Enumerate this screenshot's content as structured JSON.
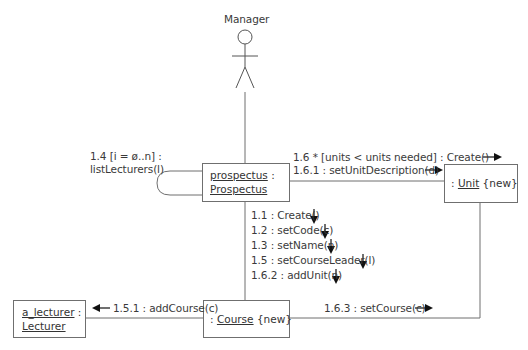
{
  "diagram": {
    "type": "UML communication diagram",
    "actor": {
      "name": "Manager"
    },
    "objects": {
      "prospectus": {
        "instance": "prospectus",
        "separator": " :",
        "class": "Prospectus"
      },
      "unit": {
        "prefix": ": ",
        "class": "Unit",
        "suffix": " {new}"
      },
      "course": {
        "prefix": ": ",
        "class": "Course",
        "suffix": " {new}"
      },
      "lecturer": {
        "instance": "a_lecturer",
        "separator": " :",
        "class": "Lecturer"
      }
    },
    "messages": {
      "self_loop_line1": "1.4  [i = ø..n] :",
      "self_loop_line2": "listLecturers(l)",
      "to_unit_1": "1.6 * [units < units needed] : Create()",
      "to_unit_2": "1.6.1 : setUnitDescription(d)",
      "to_course": [
        "1.1 : Create()",
        "1.2 : setCode(c)",
        "1.3 : setName(n)",
        "1.5 : setCourseLeader(l)",
        "1.6.2 : addUnit(n)"
      ],
      "to_lecturer": "1.5.1 : addCourse(c)",
      "course_to_unit": "1.6.3 : setCourse(c)"
    },
    "colors": {
      "line": "#6f6f6f",
      "text": "#333333",
      "arrow": "#111111"
    }
  }
}
